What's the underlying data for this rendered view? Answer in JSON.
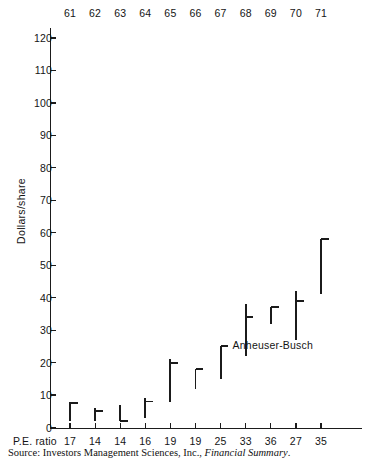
{
  "chart_data": {
    "type": "bar",
    "title": "",
    "subtitle": "",
    "xlabel": "",
    "ylabel": "Dollars/share",
    "ylim": [
      0,
      125
    ],
    "yticks": [
      0,
      10,
      20,
      30,
      40,
      50,
      60,
      70,
      80,
      90,
      100,
      110,
      120
    ],
    "ytick_labels": [
      "0",
      "10",
      "20",
      "30",
      "40",
      "50",
      "60",
      "70",
      "80",
      "90",
      "100",
      "110",
      "120"
    ],
    "grid": false,
    "legend": null,
    "categories": [
      "61",
      "62",
      "63",
      "64",
      "65",
      "66",
      "67",
      "68",
      "69",
      "70",
      "71"
    ],
    "category_axis_position": "top",
    "secondary_axis_label": "P.E. ratio",
    "secondary_axis_values": [
      17,
      14,
      14,
      16,
      19,
      19,
      25,
      33,
      36,
      27,
      35
    ],
    "series": [
      {
        "name": "Anheuser-Busch price range",
        "note": "vertical bar = annual high/low range; short horizontal tick = earnings marker",
        "points": [
          {
            "year": "61",
            "low": 2,
            "high": 8,
            "tick": 7.5,
            "tick_side": "right"
          },
          {
            "year": "62",
            "low": 2,
            "high": 6,
            "tick": 5.0,
            "tick_side": "right"
          },
          {
            "year": "63",
            "low": 2,
            "high": 7,
            "tick": 2.0,
            "tick_side": "right"
          },
          {
            "year": "64",
            "low": 3,
            "high": 9,
            "tick": 8.0,
            "tick_side": "right"
          },
          {
            "year": "65",
            "low": 8,
            "high": 21,
            "tick": 20.0,
            "tick_side": "right"
          },
          {
            "year": "66",
            "low": 12,
            "high": 18,
            "tick": 18.0,
            "tick_side": "right"
          },
          {
            "year": "67",
            "low": 15,
            "high": 25,
            "tick": 25.0,
            "tick_side": "right"
          },
          {
            "year": "68",
            "low": 22,
            "high": 38,
            "tick": 34.0,
            "tick_side": "right"
          },
          {
            "year": "69",
            "low": 32,
            "high": 37,
            "tick": 37.0,
            "tick_side": "right"
          },
          {
            "year": "70",
            "low": 27,
            "high": 42,
            "tick": 39.0,
            "tick_side": "right"
          },
          {
            "year": "71",
            "low": 41,
            "high": 58,
            "tick": 58.0,
            "tick_side": "right"
          }
        ]
      }
    ],
    "annotations": [
      {
        "name": "series-label",
        "text": "Anheuser-Busch",
        "x": "67.5",
        "y": 25
      }
    ],
    "colors": {
      "data": "#1b1b1b",
      "axis": "#1b1b1b",
      "text": "#141414",
      "background": "#ffffff"
    }
  },
  "source": {
    "prefix": "Source: Investors Management Sciences, Inc., ",
    "italic": "Financial Summary",
    "suffix": "."
  }
}
